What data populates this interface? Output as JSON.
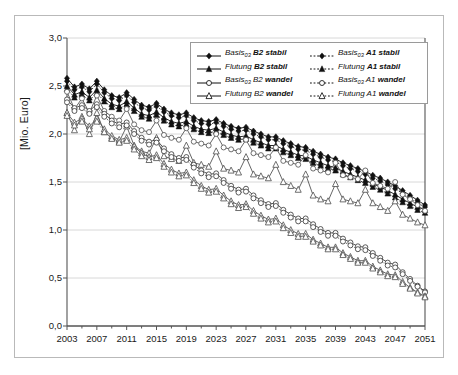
{
  "chart_data": {
    "type": "line",
    "title": "",
    "xlabel": "",
    "ylabel": "[Mio. Euro]",
    "ylim": [
      0.0,
      3.0
    ],
    "xlim": [
      2003,
      2051
    ],
    "yticks": [
      "0,0",
      "0,5",
      "1,0",
      "1,5",
      "2,0",
      "2,5",
      "3,0"
    ],
    "ytick_values": [
      0.0,
      0.5,
      1.0,
      1.5,
      2.0,
      2.5,
      3.0
    ],
    "xticks": [
      "2003",
      "2007",
      "2011",
      "2015",
      "2019",
      "2023",
      "2027",
      "2031",
      "2035",
      "2039",
      "2043",
      "2047",
      "2051"
    ],
    "xtick_values": [
      2003,
      2007,
      2011,
      2015,
      2019,
      2023,
      2027,
      2031,
      2035,
      2039,
      2043,
      2047,
      2051
    ],
    "minor_xtick_step": 2,
    "grid": "horizontal",
    "legend_position": "top-center",
    "x": [
      2003,
      2004,
      2005,
      2006,
      2007,
      2008,
      2009,
      2010,
      2011,
      2012,
      2013,
      2014,
      2015,
      2016,
      2017,
      2018,
      2019,
      2020,
      2021,
      2022,
      2023,
      2024,
      2025,
      2026,
      2027,
      2028,
      2029,
      2030,
      2031,
      2032,
      2033,
      2034,
      2035,
      2036,
      2037,
      2038,
      2039,
      2040,
      2041,
      2042,
      2043,
      2044,
      2045,
      2046,
      2047,
      2048,
      2049,
      2050,
      2051
    ],
    "series": [
      {
        "name": "Basis03 B2 stabil",
        "label_main": "Basis",
        "label_sub": "03",
        "label_tail": " B2 stabil",
        "marker": "filled-diamond",
        "line": "solid",
        "color": "#111111",
        "values": [
          2.58,
          2.49,
          2.52,
          2.47,
          2.55,
          2.46,
          2.4,
          2.38,
          2.43,
          2.36,
          2.3,
          2.28,
          2.32,
          2.26,
          2.22,
          2.2,
          2.22,
          2.17,
          2.14,
          2.13,
          2.15,
          2.11,
          2.08,
          2.06,
          2.07,
          2.03,
          2.0,
          1.97,
          1.97,
          1.93,
          1.9,
          1.87,
          1.86,
          1.82,
          1.79,
          1.76,
          1.74,
          1.7,
          1.67,
          1.64,
          1.61,
          1.57,
          1.54,
          1.5,
          1.46,
          1.41,
          1.36,
          1.31,
          1.26
        ]
      },
      {
        "name": "Basis03 A1 stabil",
        "label_main": "Basis",
        "label_sub": "03",
        "label_tail": " A1 stabil",
        "marker": "filled-diamond",
        "line": "dotted",
        "color": "#111111",
        "values": [
          2.55,
          2.46,
          2.49,
          2.44,
          2.52,
          2.43,
          2.37,
          2.35,
          2.4,
          2.33,
          2.27,
          2.25,
          2.29,
          2.23,
          2.19,
          2.17,
          2.19,
          2.14,
          2.11,
          2.1,
          2.12,
          2.08,
          2.05,
          2.03,
          2.04,
          2.0,
          1.97,
          1.94,
          1.94,
          1.9,
          1.87,
          1.84,
          1.83,
          1.79,
          1.76,
          1.73,
          1.71,
          1.67,
          1.64,
          1.61,
          1.58,
          1.54,
          1.51,
          1.47,
          1.43,
          1.38,
          1.33,
          1.28,
          1.24
        ]
      },
      {
        "name": "Flutung B2 stabil",
        "label_main": "Flutung",
        "label_sub": "",
        "label_tail": " B2 stabil",
        "marker": "filled-triangle",
        "line": "solid",
        "color": "#111111",
        "values": [
          2.5,
          2.41,
          2.44,
          2.38,
          2.46,
          2.37,
          2.31,
          2.29,
          2.34,
          2.27,
          2.21,
          2.19,
          2.23,
          2.17,
          2.13,
          2.11,
          2.13,
          2.08,
          2.05,
          2.04,
          2.06,
          2.02,
          1.99,
          1.97,
          1.98,
          1.94,
          1.91,
          1.88,
          1.88,
          1.84,
          1.81,
          1.78,
          1.77,
          1.73,
          1.7,
          1.67,
          1.65,
          1.61,
          1.58,
          1.55,
          1.52,
          1.48,
          1.45,
          1.41,
          1.37,
          1.32,
          1.28,
          1.24,
          1.21
        ]
      },
      {
        "name": "Flutung A1 stabil",
        "label_main": "Flutung",
        "label_sub": "",
        "label_tail": " A1 stabil",
        "marker": "filled-triangle",
        "line": "dotted",
        "color": "#111111",
        "values": [
          2.47,
          2.38,
          2.41,
          2.35,
          2.43,
          2.34,
          2.28,
          2.26,
          2.31,
          2.24,
          2.18,
          2.16,
          2.2,
          2.14,
          2.1,
          2.08,
          2.1,
          2.05,
          2.02,
          2.01,
          2.03,
          1.99,
          1.96,
          1.94,
          1.95,
          1.91,
          1.88,
          1.85,
          1.85,
          1.81,
          1.78,
          1.75,
          1.74,
          1.7,
          1.67,
          1.64,
          1.62,
          1.58,
          1.55,
          1.52,
          1.49,
          1.45,
          1.42,
          1.38,
          1.34,
          1.29,
          1.25,
          1.21,
          1.18
        ]
      },
      {
        "name": "Basis03 B2 wandel-upper-open",
        "label_main": "",
        "label_sub": "",
        "label_tail": "",
        "marker": "open-circle",
        "line": "solid",
        "color": "#555555",
        "hidden_from_legend": true,
        "values": [
          2.44,
          2.26,
          2.37,
          2.22,
          2.4,
          2.24,
          2.18,
          2.14,
          2.26,
          2.1,
          2.04,
          2.02,
          2.14,
          1.99,
          1.96,
          1.94,
          2.06,
          1.92,
          1.9,
          1.88,
          2.0,
          1.86,
          1.84,
          1.82,
          1.94,
          1.8,
          1.78,
          1.76,
          1.86,
          1.72,
          1.7,
          1.68,
          1.78,
          1.64,
          1.62,
          1.6,
          1.7,
          1.57,
          1.55,
          1.53,
          1.62,
          1.49,
          1.46,
          1.43,
          1.5,
          1.37,
          1.32,
          1.26,
          1.2
        ]
      },
      {
        "name": "Flutung B2 wandel-upper-open",
        "label_main": "",
        "label_sub": "",
        "label_tail": "",
        "marker": "open-triangle",
        "line": "solid",
        "color": "#555555",
        "hidden_from_legend": true,
        "values": [
          2.22,
          2.04,
          2.18,
          2.0,
          2.22,
          2.02,
          1.96,
          1.92,
          2.08,
          1.88,
          1.82,
          1.8,
          1.96,
          1.77,
          1.74,
          1.72,
          1.88,
          1.7,
          1.68,
          1.66,
          1.82,
          1.64,
          1.62,
          1.6,
          1.76,
          1.58,
          1.56,
          1.54,
          1.68,
          1.5,
          1.46,
          1.42,
          1.58,
          1.36,
          1.32,
          1.3,
          1.48,
          1.32,
          1.3,
          1.28,
          1.42,
          1.28,
          1.24,
          1.2,
          1.3,
          1.16,
          1.12,
          1.08,
          1.05
        ]
      },
      {
        "name": "Basis03 B2 wandel",
        "label_main": "Basis",
        "label_sub": "03",
        "label_tail": " B2 wandel",
        "marker": "open-circle",
        "line": "solid",
        "color": "#3f3f3f",
        "values": [
          2.36,
          2.27,
          2.3,
          2.24,
          2.31,
          2.21,
          2.14,
          2.1,
          2.12,
          2.03,
          1.96,
          1.92,
          1.94,
          1.85,
          1.79,
          1.75,
          1.76,
          1.68,
          1.62,
          1.58,
          1.59,
          1.52,
          1.46,
          1.42,
          1.43,
          1.36,
          1.31,
          1.27,
          1.28,
          1.21,
          1.16,
          1.12,
          1.12,
          1.06,
          1.01,
          0.97,
          0.97,
          0.91,
          0.87,
          0.83,
          0.82,
          0.76,
          0.71,
          0.66,
          0.64,
          0.56,
          0.49,
          0.42,
          0.36
        ]
      },
      {
        "name": "Basis03 A1 wandel",
        "label_main": "Basis",
        "label_sub": "03",
        "label_tail": " A1 wandel",
        "marker": "open-circle",
        "line": "dotted",
        "color": "#3f3f3f",
        "values": [
          2.33,
          2.24,
          2.27,
          2.21,
          2.28,
          2.18,
          2.11,
          2.07,
          2.09,
          2.0,
          1.93,
          1.89,
          1.91,
          1.82,
          1.76,
          1.72,
          1.73,
          1.65,
          1.59,
          1.55,
          1.56,
          1.49,
          1.43,
          1.39,
          1.4,
          1.33,
          1.28,
          1.24,
          1.25,
          1.18,
          1.13,
          1.09,
          1.09,
          1.03,
          0.98,
          0.94,
          0.94,
          0.88,
          0.84,
          0.8,
          0.79,
          0.73,
          0.68,
          0.63,
          0.61,
          0.54,
          0.47,
          0.41,
          0.35
        ]
      },
      {
        "name": "Flutung B2 wandel",
        "label_main": "Flutung",
        "label_sub": "",
        "label_tail": " B2 wandel",
        "marker": "open-triangle",
        "line": "solid",
        "color": "#555555",
        "values": [
          2.22,
          2.12,
          2.16,
          2.08,
          2.16,
          2.05,
          1.98,
          1.94,
          1.96,
          1.87,
          1.8,
          1.76,
          1.78,
          1.69,
          1.63,
          1.59,
          1.6,
          1.52,
          1.46,
          1.42,
          1.43,
          1.36,
          1.3,
          1.26,
          1.27,
          1.2,
          1.15,
          1.11,
          1.12,
          1.05,
          1.0,
          0.96,
          0.96,
          0.9,
          0.86,
          0.82,
          0.82,
          0.76,
          0.72,
          0.68,
          0.68,
          0.62,
          0.58,
          0.54,
          0.53,
          0.46,
          0.4,
          0.35,
          0.31
        ]
      },
      {
        "name": "Flutung A1 wandel",
        "label_main": "Flutung",
        "label_sub": "",
        "label_tail": " A1 wandel",
        "marker": "open-triangle",
        "line": "dotted",
        "color": "#555555",
        "values": [
          2.19,
          2.09,
          2.13,
          2.05,
          2.13,
          2.02,
          1.95,
          1.91,
          1.93,
          1.84,
          1.77,
          1.73,
          1.75,
          1.66,
          1.6,
          1.56,
          1.57,
          1.49,
          1.43,
          1.39,
          1.4,
          1.33,
          1.27,
          1.23,
          1.24,
          1.17,
          1.12,
          1.08,
          1.09,
          1.02,
          0.97,
          0.93,
          0.93,
          0.88,
          0.84,
          0.8,
          0.8,
          0.74,
          0.7,
          0.66,
          0.66,
          0.6,
          0.56,
          0.52,
          0.51,
          0.44,
          0.39,
          0.34,
          0.3
        ]
      }
    ]
  },
  "legend": {
    "entries": [
      {
        "text_main": "Basis",
        "sub": "03",
        "tail": " B2 stabil",
        "marker": "filled-diamond",
        "line": "solid",
        "col": "left"
      },
      {
        "text_main": "Flutung",
        "sub": "",
        "tail": " B2 stabil",
        "marker": "filled-triangle",
        "line": "solid",
        "col": "left"
      },
      {
        "text_main": "Basis",
        "sub": "03",
        "tail": " B2 wandel",
        "marker": "open-circle",
        "line": "solid",
        "col": "left"
      },
      {
        "text_main": "Flutung",
        "sub": "",
        "tail": " B2 wandel",
        "marker": "open-triangle",
        "line": "solid",
        "col": "left"
      },
      {
        "text_main": "Basis",
        "sub": "03",
        "tail": " A1 stabil",
        "marker": "filled-diamond",
        "line": "dotted",
        "col": "right"
      },
      {
        "text_main": "Flutung",
        "sub": "",
        "tail": " A1 stabil",
        "marker": "filled-triangle",
        "line": "dotted",
        "col": "right"
      },
      {
        "text_main": "Basis",
        "sub": "03",
        "tail": " A1 wandel",
        "marker": "open-circle",
        "line": "dotted",
        "col": "right"
      },
      {
        "text_main": "Flutung",
        "sub": "",
        "tail": " A1 wandel",
        "marker": "open-triangle",
        "line": "dotted",
        "col": "right"
      }
    ]
  },
  "colors": {
    "axis": "#555555",
    "grid": "#d8d8d8",
    "frame": "#b9b9b9",
    "ink": "#111111",
    "background": "#ffffff"
  }
}
